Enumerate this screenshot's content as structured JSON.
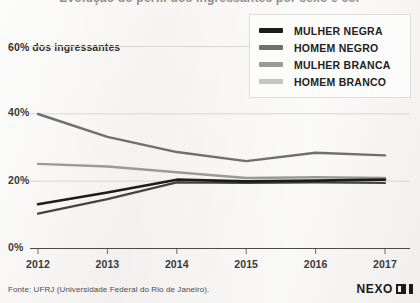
{
  "title_clipped": "Evolução do perfil dos ingressantes por sexo e cor",
  "axis_note": "60% dos ingressantes",
  "legend": {
    "items": [
      {
        "label": "MULHER NEGRA",
        "color": "#1c1c1c"
      },
      {
        "label": "HOMEM NEGRO",
        "color": "#6f6f6f"
      },
      {
        "label": "MULHER BRANCA",
        "color": "#9a9a9a"
      },
      {
        "label": "HOMEM BRANCO",
        "color": "#c3c3c3"
      }
    ]
  },
  "footer": {
    "source": "Fonte: UFRJ (Universidade Federal do Rio de Janeiro).",
    "brand": "NEXO"
  },
  "chart_data": {
    "type": "line",
    "title": "Evolução do perfil dos ingressantes por sexo e cor",
    "xlabel": "",
    "ylabel": "60% dos ingressantes",
    "x": [
      "2012",
      "2013",
      "2014",
      "2015",
      "2016",
      "2017"
    ],
    "categories": [
      "2012",
      "2013",
      "2014",
      "2015",
      "2016",
      "2017"
    ],
    "ylim": [
      0,
      60
    ],
    "yticks": [
      0,
      20,
      40,
      60
    ],
    "ytick_labels": [
      "0%",
      "20%",
      "40%",
      "60%"
    ],
    "grid": true,
    "legend_position": "top-right",
    "series": [
      {
        "name": "MULHER NEGRA",
        "color": "#1c1c1c",
        "values": [
          13.0,
          16.5,
          20.3,
          19.8,
          20.0,
          20.3
        ]
      },
      {
        "name": "HOMEM NEGRO",
        "color": "#6f6f6f",
        "values": [
          39.8,
          33.0,
          28.5,
          25.8,
          28.3,
          27.5
        ]
      },
      {
        "name": "MULHER BRANCA",
        "color": "#9a9a9a",
        "values": [
          25.0,
          24.2,
          22.5,
          20.8,
          21.0,
          20.8
        ]
      },
      {
        "name": "HOMEM BRANCO",
        "color": "#444444",
        "values": [
          10.2,
          14.5,
          19.5,
          19.3,
          19.5,
          19.3
        ]
      }
    ]
  }
}
